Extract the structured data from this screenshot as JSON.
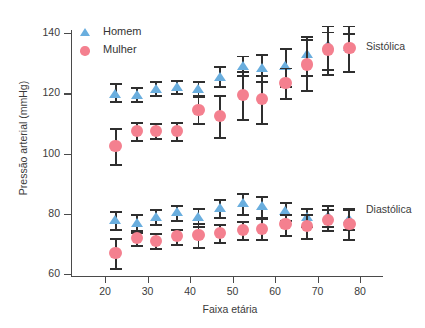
{
  "chart_data": {
    "type": "scatter",
    "title": "",
    "xlabel": "Faixa etária",
    "ylabel": "Pressão arterial (mmHg)",
    "xlim": [
      15,
      88
    ],
    "ylim": [
      60,
      140
    ],
    "xticks": [
      20,
      30,
      40,
      50,
      60,
      70,
      80
    ],
    "yticks": [
      60,
      80,
      100,
      120,
      140
    ],
    "grid": false,
    "legend_position": "top-left",
    "error_bars": "vertical with caps (95% CI style)",
    "legend": [
      {
        "name": "Homem",
        "marker": "triangle",
        "color": "#6aaede"
      },
      {
        "name": "Mulher",
        "marker": "circle",
        "color": "#f4808f"
      }
    ],
    "annotations": [
      {
        "text": "Sistólica",
        "x": 84,
        "y": 133
      },
      {
        "text": "Diastólica",
        "x": 84,
        "y": 79
      }
    ],
    "x": [
      22.5,
      27.5,
      32,
      37,
      42,
      47,
      52.5,
      57,
      62.5,
      67.5,
      72.5,
      77.5
    ],
    "groups": [
      {
        "name": "Sistólica",
        "series": [
          {
            "name": "Homem",
            "color": "#6aaede",
            "x": [
              22.5,
              27.5,
              32,
              37,
              42,
              47,
              52.5,
              57,
              62.5,
              67.5,
              72.5,
              77.5
            ],
            "values": [
              120.0,
              119.5,
              121.5,
              122.0,
              121.5,
              125.5,
              129.0,
              128.5,
              129.0,
              133.0,
              136.0,
              135.5
            ],
            "err_low": [
              117.5,
              117.5,
              119.5,
              120.0,
              119.5,
              122.5,
              126.0,
              124.0,
              122.5,
              126.0,
              128.0,
              127.5
            ],
            "err_high": [
              123.5,
              122.0,
              124.0,
              124.5,
              124.0,
              129.0,
              132.5,
              133.0,
              135.0,
              139.0,
              140.5,
              140.0
            ]
          },
          {
            "name": "Mulher",
            "color": "#f4808f",
            "x": [
              22.5,
              27.5,
              32,
              37,
              42,
              47,
              52.5,
              57,
              62.5,
              67.5,
              72.5,
              77.5
            ],
            "values": [
              102.5,
              107.5,
              107.5,
              107.5,
              114.5,
              112.5,
              119.5,
              118.0,
              123.5,
              129.5,
              134.5,
              135.0
            ],
            "err_low": [
              96.5,
              104.5,
              105.0,
              104.5,
              110.0,
              105.5,
              111.5,
              110.0,
              118.5,
              121.0,
              126.5,
              127.5
            ],
            "err_high": [
              108.5,
              110.5,
              110.0,
              110.5,
              119.0,
              119.5,
              127.5,
              126.0,
              128.5,
              138.0,
              142.5,
              142.5
            ]
          }
        ]
      },
      {
        "name": "Diastólica",
        "series": [
          {
            "name": "Homem",
            "color": "#6aaede",
            "x": [
              22.5,
              27.5,
              32,
              37,
              42,
              47,
              52.5,
              57,
              62.5,
              67.5,
              72.5,
              77.5
            ],
            "values": [
              78.0,
              77.0,
              79.0,
              80.5,
              79.0,
              82.0,
              83.5,
              82.5,
              81.0,
              79.0,
              79.5,
              78.5
            ],
            "err_low": [
              75.0,
              74.0,
              76.5,
              78.0,
              76.0,
              79.0,
              80.0,
              79.0,
              78.0,
              76.0,
              76.0,
              75.0
            ],
            "err_high": [
              81.0,
              80.0,
              81.5,
              83.0,
              82.0,
              85.0,
              87.0,
              86.0,
              84.0,
              82.0,
              83.0,
              82.0
            ]
          },
          {
            "name": "Mulher",
            "color": "#f4808f",
            "x": [
              22.5,
              27.5,
              32,
              37,
              42,
              47,
              52.5,
              57,
              62.5,
              67.5,
              72.5,
              77.5
            ],
            "values": [
              67.0,
              72.0,
              71.0,
              72.5,
              73.0,
              73.5,
              74.5,
              75.0,
              76.5,
              76.0,
              78.0,
              76.5
            ],
            "err_low": [
              62.0,
              69.5,
              68.5,
              70.0,
              69.0,
              70.5,
              71.5,
              71.5,
              73.0,
              72.0,
              74.5,
              71.5
            ],
            "err_high": [
              72.0,
              74.5,
              73.5,
              75.0,
              77.0,
              76.5,
              77.5,
              78.5,
              80.0,
              80.0,
              81.5,
              81.5
            ]
          }
        ]
      }
    ]
  },
  "axis": {
    "ylabel": "Pressão arterial (mmHg)",
    "xlabel": "Faixa etária",
    "yticks": [
      "140",
      "120",
      "100",
      "80",
      "60"
    ],
    "xticks": [
      "20",
      "30",
      "40",
      "50",
      "60",
      "70",
      "80"
    ]
  },
  "legend": {
    "male_label": "Homem",
    "female_label": "Mulher"
  },
  "annotations": {
    "systolic_label": "Sistólica",
    "diastolic_label": "Diastólica"
  },
  "colors": {
    "male": "#6aaede",
    "female": "#f4808f",
    "error_bar": "#2f2f2f",
    "axis": "#4a4a4a",
    "text": "#3b3b3b",
    "background": "#ffffff"
  }
}
